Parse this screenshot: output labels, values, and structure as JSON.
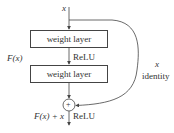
{
  "diagram": {
    "type": "residual-block",
    "input_label": "x",
    "layers": [
      {
        "label": "weight layer"
      },
      {
        "label": "weight layer"
      }
    ],
    "activation_mid": "ReLU",
    "residual_function_label": "F(x)",
    "shortcut": {
      "var_label": "x",
      "name_label": "identity"
    },
    "sum_symbol": "+",
    "output_label": "F(x) + x",
    "activation_out": "ReLU"
  },
  "colors": {
    "stroke": "#444444",
    "text": "#333333",
    "background": "#ffffff"
  }
}
